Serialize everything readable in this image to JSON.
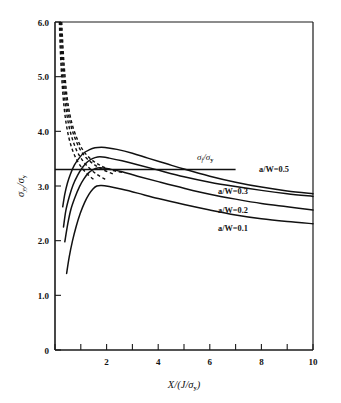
{
  "chart_data": {
    "type": "line",
    "title": "",
    "subtitle": "",
    "xlabel": "X/(J/σy)",
    "ylabel": "σyy/σy",
    "xlim": [
      0,
      10
    ],
    "ylim": [
      0,
      6.0
    ],
    "grid": false,
    "legend_position": "inline-right",
    "x_ticks": [
      0,
      1,
      2,
      3,
      4,
      5,
      6,
      7,
      8,
      9,
      10
    ],
    "x_tick_labels": [
      "0",
      "",
      "2",
      "",
      "4",
      "",
      "6",
      "",
      "8",
      "",
      "10"
    ],
    "y_ticks": [
      0,
      1.0,
      2.0,
      3.0,
      4.0,
      5.0,
      6.0
    ],
    "y_tick_labels": [
      "0",
      "1.0",
      "2.0",
      "3.0",
      "4.0",
      "5.0",
      "6.0"
    ],
    "reference_line": {
      "name": "flow-stress-ratio",
      "label": "σf/σy",
      "orientation": "horizontal",
      "value": 3.3,
      "x_start": 0.0,
      "x_end": 7.0,
      "style": "solid"
    },
    "series": [
      {
        "name": "a/W=0.5",
        "label": "a/W=0.5",
        "style": "solid",
        "points": [
          [
            0.3,
            2.62
          ],
          [
            0.38,
            2.85
          ],
          [
            0.48,
            3.05
          ],
          [
            0.6,
            3.22
          ],
          [
            0.75,
            3.38
          ],
          [
            0.92,
            3.5
          ],
          [
            1.1,
            3.6
          ],
          [
            1.32,
            3.66
          ],
          [
            1.55,
            3.7
          ],
          [
            1.8,
            3.71
          ],
          [
            2.0,
            3.7
          ],
          [
            2.4,
            3.67
          ],
          [
            3.0,
            3.6
          ],
          [
            3.6,
            3.51
          ],
          [
            4.3,
            3.41
          ],
          [
            5.0,
            3.31
          ],
          [
            6.0,
            3.18
          ],
          [
            7.0,
            3.07
          ],
          [
            8.0,
            2.98
          ],
          [
            9.0,
            2.91
          ],
          [
            10.0,
            2.86
          ]
        ]
      },
      {
        "name": "a/W=0.3",
        "label": "a/W=0.3",
        "style": "solid",
        "points": [
          [
            0.33,
            2.25
          ],
          [
            0.42,
            2.55
          ],
          [
            0.55,
            2.8
          ],
          [
            0.7,
            3.02
          ],
          [
            0.88,
            3.2
          ],
          [
            1.05,
            3.33
          ],
          [
            1.25,
            3.44
          ],
          [
            1.45,
            3.5
          ],
          [
            1.65,
            3.53
          ],
          [
            1.85,
            3.53
          ],
          [
            2.1,
            3.51
          ],
          [
            2.6,
            3.46
          ],
          [
            3.2,
            3.39
          ],
          [
            4.0,
            3.29
          ],
          [
            5.0,
            3.17
          ],
          [
            6.0,
            3.07
          ],
          [
            7.0,
            2.99
          ],
          [
            8.0,
            2.92
          ],
          [
            9.0,
            2.86
          ],
          [
            10.0,
            2.81
          ]
        ]
      },
      {
        "name": "a/W=0.2",
        "label": "a/W=0.2",
        "style": "solid",
        "points": [
          [
            0.38,
            1.98
          ],
          [
            0.5,
            2.32
          ],
          [
            0.62,
            2.58
          ],
          [
            0.78,
            2.8
          ],
          [
            0.95,
            2.99
          ],
          [
            1.12,
            3.13
          ],
          [
            1.3,
            3.24
          ],
          [
            1.48,
            3.3
          ],
          [
            1.65,
            3.33
          ],
          [
            1.85,
            3.33
          ],
          [
            2.1,
            3.31
          ],
          [
            2.6,
            3.26
          ],
          [
            3.2,
            3.18
          ],
          [
            4.0,
            3.08
          ],
          [
            5.0,
            2.96
          ],
          [
            6.0,
            2.85
          ],
          [
            7.0,
            2.76
          ],
          [
            8.0,
            2.68
          ],
          [
            9.0,
            2.62
          ],
          [
            10.0,
            2.56
          ]
        ]
      },
      {
        "name": "a/W=0.1",
        "label": "a/W=0.1",
        "style": "solid",
        "points": [
          [
            0.45,
            1.4
          ],
          [
            0.55,
            1.7
          ],
          [
            0.68,
            2.0
          ],
          [
            0.82,
            2.26
          ],
          [
            0.98,
            2.5
          ],
          [
            1.15,
            2.7
          ],
          [
            1.32,
            2.85
          ],
          [
            1.48,
            2.95
          ],
          [
            1.62,
            3.0
          ],
          [
            1.8,
            3.01
          ],
          [
            2.1,
            2.99
          ],
          [
            2.6,
            2.94
          ],
          [
            3.2,
            2.87
          ],
          [
            4.0,
            2.77
          ],
          [
            5.0,
            2.66
          ],
          [
            6.0,
            2.56
          ],
          [
            7.0,
            2.47
          ],
          [
            8.0,
            2.4
          ],
          [
            9.0,
            2.35
          ],
          [
            10.0,
            2.31
          ]
        ]
      }
    ],
    "asymptote_series": [
      {
        "name": "hrr-asymptote-1",
        "style": "dashed",
        "points": [
          [
            0.17,
            6.0
          ],
          [
            0.2,
            5.55
          ],
          [
            0.24,
            5.15
          ],
          [
            0.29,
            4.78
          ],
          [
            0.35,
            4.45
          ],
          [
            0.43,
            4.15
          ],
          [
            0.53,
            3.9
          ],
          [
            0.66,
            3.68
          ],
          [
            0.82,
            3.5
          ],
          [
            1.0,
            3.36
          ],
          [
            1.25,
            3.22
          ],
          [
            1.55,
            3.1
          ]
        ]
      },
      {
        "name": "hrr-asymptote-2",
        "style": "dashed",
        "points": [
          [
            0.2,
            6.0
          ],
          [
            0.24,
            5.5
          ],
          [
            0.29,
            5.08
          ],
          [
            0.35,
            4.72
          ],
          [
            0.43,
            4.4
          ],
          [
            0.53,
            4.12
          ],
          [
            0.66,
            3.88
          ],
          [
            0.82,
            3.67
          ],
          [
            1.02,
            3.5
          ],
          [
            1.28,
            3.35
          ],
          [
            1.6,
            3.22
          ],
          [
            1.95,
            3.12
          ]
        ]
      },
      {
        "name": "hrr-asymptote-3",
        "style": "dashed",
        "points": [
          [
            0.23,
            6.0
          ],
          [
            0.28,
            5.48
          ],
          [
            0.34,
            5.05
          ],
          [
            0.41,
            4.68
          ],
          [
            0.5,
            4.37
          ],
          [
            0.62,
            4.1
          ],
          [
            0.77,
            3.88
          ],
          [
            0.96,
            3.68
          ],
          [
            1.2,
            3.52
          ],
          [
            1.5,
            3.4
          ],
          [
            1.85,
            3.3
          ],
          [
            2.25,
            3.22
          ]
        ]
      },
      {
        "name": "hrr-asymptote-4",
        "style": "dashed",
        "points": [
          [
            0.26,
            6.0
          ],
          [
            0.32,
            5.45
          ],
          [
            0.39,
            5.0
          ],
          [
            0.47,
            4.62
          ],
          [
            0.58,
            4.3
          ],
          [
            0.72,
            4.04
          ],
          [
            0.9,
            3.82
          ],
          [
            1.12,
            3.63
          ],
          [
            1.42,
            3.48
          ],
          [
            1.78,
            3.37
          ],
          [
            2.2,
            3.29
          ],
          [
            2.7,
            3.24
          ]
        ]
      }
    ],
    "annotations": [
      {
        "name": "label-aw-05",
        "text": "a/W=0.5",
        "x": 7.9,
        "y": 3.24
      },
      {
        "name": "label-aw-03",
        "text": "a/W=0.3",
        "x": 6.3,
        "y": 2.95
      },
      {
        "name": "label-aw-02",
        "text": "a/W=0.2",
        "x": 6.3,
        "y": 2.66
      },
      {
        "name": "label-aw-01",
        "text": "a/W=0.1",
        "x": 6.3,
        "y": 2.42
      },
      {
        "name": "label-sigma-f",
        "text": "σf/σy",
        "x": 5.9,
        "y": 3.52
      }
    ]
  },
  "axes": {
    "y_label_parts": {
      "base": "σ",
      "sub1": "yy",
      "slash": "/",
      "base2": "σ",
      "sub2": "y"
    },
    "x_label_parts": {
      "x": "X",
      "open": "/(",
      "j": "J",
      "slash": "/",
      "sigma": "σ",
      "sub": "y",
      "close": ")"
    },
    "ref_label_parts": {
      "sigma": "σ",
      "sub1": "f",
      "slash": "/",
      "sigma2": "σ",
      "sub2": "y"
    }
  },
  "colors": {
    "background": "#ffffff",
    "ink": "#111111",
    "axis": "#1a1a1a"
  }
}
